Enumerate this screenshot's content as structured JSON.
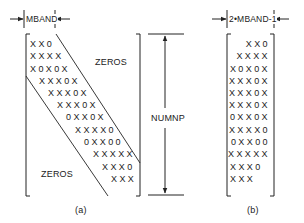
{
  "diagram": {
    "panel_a": {
      "caption": "(a)",
      "dimension_label": "MBAND",
      "height_label": "NUMNP",
      "upper_region_label": "ZEROS",
      "lower_region_label": "ZEROS",
      "rows": [
        "XX0",
        "XXXX",
        "X0X0X",
        "XXX0X",
        "XXX0X",
        "XXX0X",
        "0XX0X",
        "XXXX0",
        "0XX00",
        "XXXXX",
        "XXX0",
        "XXX"
      ]
    },
    "panel_b": {
      "caption": "(b)",
      "dimension_label": "2•MBAND-1",
      "rows": [
        "XX0",
        "XXXX",
        "X0X0X",
        "XXX0X",
        "XXX0X",
        "XXX0X",
        "0XX0X",
        "XXXX0",
        "0XX00",
        "XXXXX",
        "XXX0",
        "XXX"
      ]
    },
    "colors": {
      "ink": "#222222",
      "background": "#ffffff"
    }
  }
}
